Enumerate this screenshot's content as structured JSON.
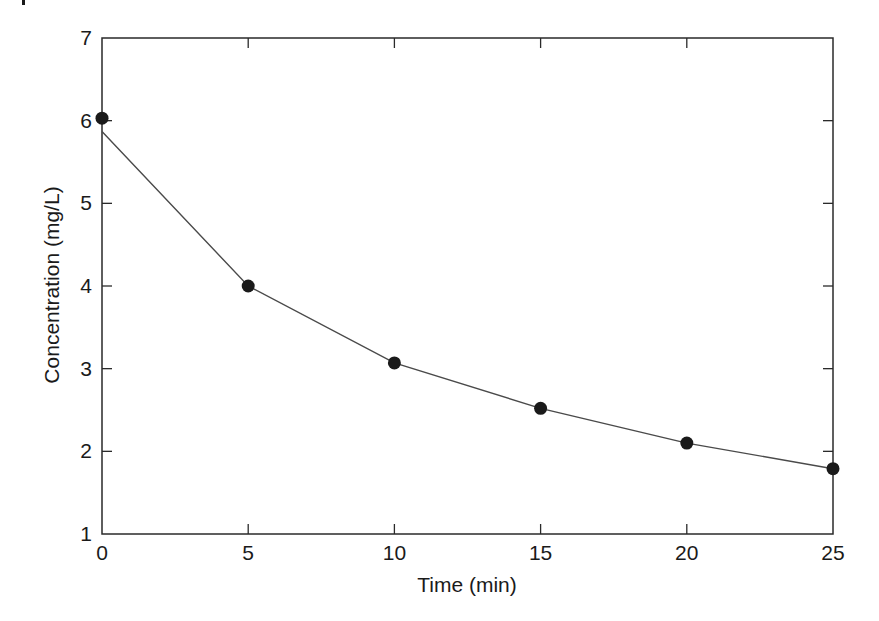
{
  "chart_data": {
    "type": "line",
    "title": "",
    "xlabel": "Time (min)",
    "ylabel": "Concentration (mg/L)",
    "xlim": [
      0,
      25
    ],
    "ylim": [
      1,
      7
    ],
    "x_ticks": [
      0,
      5,
      10,
      15,
      20,
      25
    ],
    "y_ticks": [
      1,
      2,
      3,
      4,
      5,
      6,
      7
    ],
    "x_tick_labels": [
      "0",
      "5",
      "10",
      "15",
      "20",
      "25"
    ],
    "y_tick_labels": [
      "1",
      "2",
      "3",
      "4",
      "5",
      "6",
      "7"
    ],
    "grid": false,
    "legend": null,
    "tick_direction": "in",
    "mirrored_ticks": true,
    "series": [
      {
        "name": "Measured",
        "style": "markers",
        "marker": "filled-circle",
        "color": "#1a1a1a",
        "x": [
          0,
          5,
          10,
          15,
          20,
          25
        ],
        "values": [
          6.03,
          4.0,
          3.07,
          2.52,
          2.1,
          1.79
        ]
      },
      {
        "name": "Fitted curve",
        "style": "line",
        "color": "#4a4a4a",
        "x": [
          0,
          5,
          10,
          15,
          20,
          25
        ],
        "values": [
          5.87,
          4.0,
          3.07,
          2.52,
          2.1,
          1.79
        ]
      }
    ]
  },
  "colors": {
    "axis": "#2a2a2a",
    "marker": "#1a1a1a",
    "line": "#4a4a4a",
    "background": "#ffffff"
  }
}
